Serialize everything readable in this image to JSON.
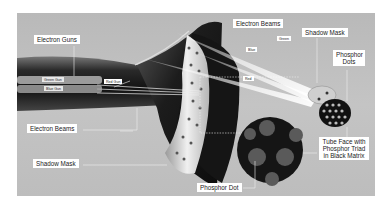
{
  "diagram": {
    "labels": {
      "electron_guns": "Electron Guns",
      "green_gun": "Green Gun",
      "blue_gun": "Blue Gun",
      "red_gun": "Red Gun",
      "electron_beams_left": "Electron Beams",
      "shadow_mask_left": "Shadow Mask",
      "electron_beams_right": "Electron Beams",
      "beam_green": "Green",
      "beam_blue": "Blue",
      "beam_red": "Red",
      "shadow_mask_right": "Shadow Mask",
      "phosphor_dots": "Phosphor Dots",
      "phosphor_dot": "Phosphor Dot",
      "tube_face": "Tube Face with Phosphor Triad in Black Matrix"
    },
    "colors": {
      "background": "#c0c0c0",
      "tube_body": "#1a1a1a",
      "shadow_mask": "#d8d8d8",
      "matrix": "#151515",
      "phosphor": "#5a5a5a",
      "label_bg": "#ffffff"
    }
  }
}
